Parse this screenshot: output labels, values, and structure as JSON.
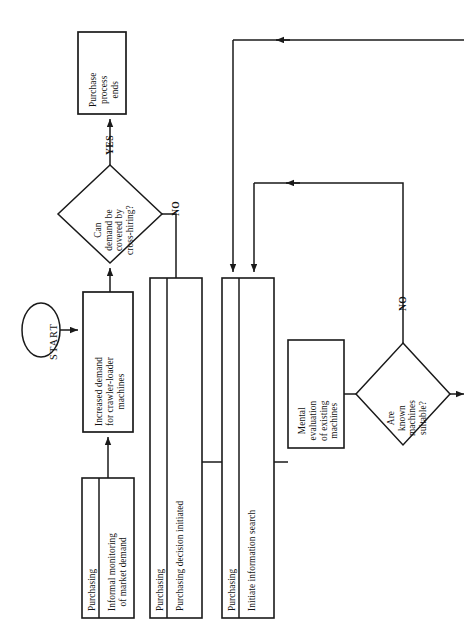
{
  "diagram": {
    "orientation": "rotated-90-ccw",
    "stroke_color": "#1a1a1a",
    "fill_color": "#ffffff",
    "nodes": [
      {
        "id": "start",
        "shape": "ellipse",
        "label": "START"
      },
      {
        "id": "purchase-process-ends",
        "shape": "rectangle",
        "label": "Purchase\nprocess\nends"
      },
      {
        "id": "cross-hiring-decision",
        "shape": "diamond",
        "label": "Can\ndemand be\ncovered by\ncross-hiring?"
      },
      {
        "id": "increased-demand",
        "shape": "rectangle",
        "label": "Increased demand\nfor crawler-loader\nmachines"
      },
      {
        "id": "informal-monitoring",
        "shape": "lane-rectangle",
        "lane": "Purchasing",
        "label": "Informal monitoring\nof market demand"
      },
      {
        "id": "purchasing-decision-initiated",
        "shape": "lane-rectangle",
        "lane": "Purchasing",
        "label": "Purchasing decision initiated"
      },
      {
        "id": "initiate-information-search",
        "shape": "lane-rectangle",
        "lane": "Purchasing",
        "label": "Initiate information search"
      },
      {
        "id": "mental-evaluation",
        "shape": "rectangle",
        "label": "Mental\nevaluation\nof existing\nmachines"
      },
      {
        "id": "known-machines-decision",
        "shape": "diamond",
        "label": "Are\nknown\nmachines\nsuitable?"
      }
    ],
    "edge_labels": {
      "yes": "YES",
      "no_cross_hiring": "NO",
      "no_known_machines": "NO"
    }
  }
}
